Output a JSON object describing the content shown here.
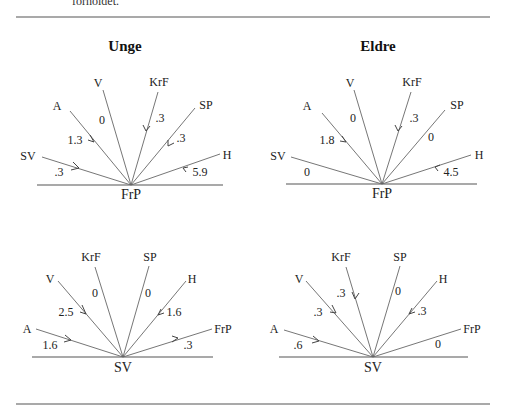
{
  "header": {
    "cut_text": "forholdet."
  },
  "columns": [
    {
      "title": "Unge"
    },
    {
      "title": "Eldre"
    }
  ],
  "diagrams": [
    {
      "id": "unge-frp",
      "hub": "FrP",
      "rays": [
        {
          "label": "SV",
          "value": ".3",
          "direction": "in"
        },
        {
          "label": "A",
          "value": "1.3",
          "direction": "in"
        },
        {
          "label": "V",
          "value": "0",
          "direction": "none"
        },
        {
          "label": "KrF",
          "value": ".3",
          "direction": "in"
        },
        {
          "label": "SP",
          "value": ".3",
          "direction": "in"
        },
        {
          "label": "H",
          "value": "5.9",
          "direction": "in"
        }
      ]
    },
    {
      "id": "eldre-frp",
      "hub": "FrP",
      "rays": [
        {
          "label": "SV",
          "value": "0",
          "direction": "none"
        },
        {
          "label": "A",
          "value": "1.8",
          "direction": "in"
        },
        {
          "label": "V",
          "value": "0",
          "direction": "none"
        },
        {
          "label": "KrF",
          "value": ".3",
          "direction": "in"
        },
        {
          "label": "SP",
          "value": "0",
          "direction": "none"
        },
        {
          "label": "H",
          "value": "4.5",
          "direction": "in"
        }
      ]
    },
    {
      "id": "unge-sv",
      "hub": "SV",
      "rays": [
        {
          "label": "A",
          "value": "1.6",
          "direction": "in"
        },
        {
          "label": "V",
          "value": "2.5",
          "direction": "in"
        },
        {
          "label": "KrF",
          "value": "0",
          "direction": "none"
        },
        {
          "label": "SP",
          "value": "0",
          "direction": "none"
        },
        {
          "label": "H",
          "value": "1.6",
          "direction": "in"
        },
        {
          "label": "FrP",
          "value": ".3",
          "direction": "out"
        }
      ]
    },
    {
      "id": "eldre-sv",
      "hub": "SV",
      "rays": [
        {
          "label": "A",
          "value": ".6",
          "direction": "in"
        },
        {
          "label": "V",
          "value": ".3",
          "direction": "in"
        },
        {
          "label": "KrF",
          "value": ".3",
          "direction": "in"
        },
        {
          "label": "SP",
          "value": "0",
          "direction": "none"
        },
        {
          "label": "H",
          "value": ".3",
          "direction": "in"
        },
        {
          "label": "FrP",
          "value": "0",
          "direction": "none"
        }
      ]
    }
  ],
  "colors": {
    "line": "#666666",
    "text": "#222222",
    "rule": "#555555"
  }
}
